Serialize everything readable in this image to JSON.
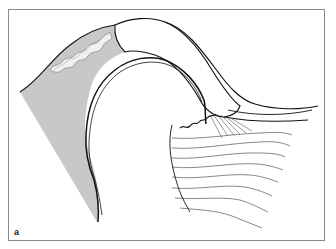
{
  "figure": {
    "panel_label": "a",
    "colors": {
      "frame": "#8a8a8a",
      "outline": "#111111",
      "shaded_tissue": "#c8c8c8",
      "wavy_band": "#ececec",
      "fiber_lines": "#555555",
      "background": "#ffffff"
    }
  }
}
